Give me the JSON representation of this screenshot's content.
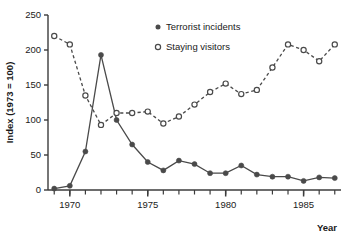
{
  "chart_data": {
    "type": "line",
    "title": "",
    "xlabel": "Year",
    "ylabel": "Index (1973 = 100)",
    "xlim": [
      1968.6,
      1987.4
    ],
    "ylim": [
      0,
      250
    ],
    "grid": false,
    "legend_position": "top-right",
    "x_tick_labels": [
      "1970",
      "1975",
      "1980",
      "1985"
    ],
    "x_tick_values": [
      1970,
      1975,
      1980,
      1985
    ],
    "x_minor_ticks": [
      1969,
      1970,
      1971,
      1972,
      1973,
      1974,
      1975,
      1976,
      1977,
      1978,
      1979,
      1980,
      1981,
      1982,
      1983,
      1984,
      1985,
      1986,
      1987
    ],
    "y_tick_labels": [
      "0",
      "50",
      "100",
      "150",
      "200",
      "250"
    ],
    "y_tick_values": [
      0,
      50,
      100,
      150,
      200,
      250
    ],
    "x": [
      1969,
      1970,
      1971,
      1972,
      1973,
      1974,
      1975,
      1976,
      1977,
      1978,
      1979,
      1980,
      1981,
      1982,
      1983,
      1984,
      1985,
      1986,
      1987
    ],
    "series": [
      {
        "name": "Terrorist incidents",
        "marker": "filled-circle",
        "line_style": "solid",
        "color": "#4a4a4a",
        "values": [
          2,
          6,
          55,
          193,
          100,
          65,
          40,
          28,
          42,
          37,
          24,
          24,
          35,
          22,
          19,
          19,
          13,
          18,
          17
        ]
      },
      {
        "name": "Staying visitors",
        "marker": "open-circle",
        "line_style": "dashed",
        "color": "#4a4a4a",
        "values": [
          220,
          208,
          135,
          93,
          110,
          110,
          112,
          95,
          105,
          122,
          140,
          152,
          137,
          143,
          175,
          208,
          200,
          184,
          208
        ]
      }
    ]
  },
  "legend": {
    "items": [
      {
        "label": "Terrorist incidents",
        "marker": "filled-circle"
      },
      {
        "label": "Staying visitors",
        "marker": "open-circle"
      }
    ]
  },
  "colors": {
    "ink": "#3c3c3c",
    "marker": "#4a4a4a",
    "background": "#ffffff"
  }
}
